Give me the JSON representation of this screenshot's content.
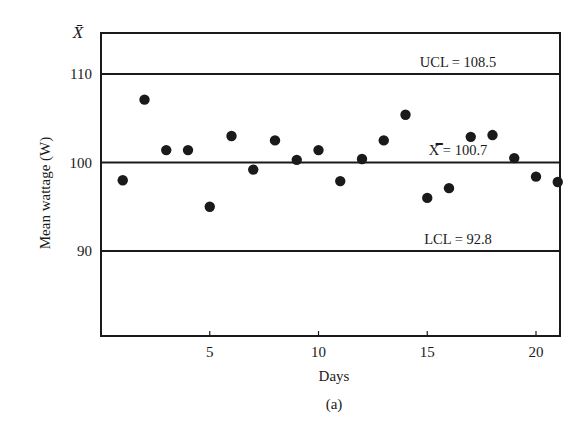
{
  "chart_data": {
    "type": "scatter",
    "title": "",
    "subtitle": "",
    "caption": "(a)",
    "xlabel": "Days",
    "ylabel": "Mean wattage (W)",
    "y_axis_symbol": "X̄",
    "xlim": [
      0,
      21
    ],
    "ylim": [
      80,
      113.5
    ],
    "x_ticks": [
      5,
      10,
      15,
      20
    ],
    "y_ticks": [
      90,
      100,
      110
    ],
    "grid": false,
    "legend": null,
    "x": [
      1,
      2,
      3,
      4,
      5,
      6,
      7,
      8,
      9,
      10,
      11,
      12,
      13,
      14,
      15,
      16,
      17,
      18,
      19,
      20,
      21
    ],
    "series": [
      {
        "name": "Daily mean wattage",
        "marker": "filled-circle",
        "values": [
          98.0,
          107.1,
          101.4,
          101.4,
          95.0,
          103.0,
          99.2,
          102.5,
          100.3,
          101.4,
          97.9,
          100.4,
          102.5,
          105.4,
          96.0,
          97.1,
          102.9,
          103.1,
          100.5,
          98.4,
          97.8
        ]
      }
    ],
    "control_lines": [
      {
        "name": "UCL",
        "label": "UCL = 108.5",
        "value": 108.5,
        "draw_at": 110
      },
      {
        "name": "center",
        "label": "X̿ = 100.7",
        "value": 100.7,
        "draw_at": 100
      },
      {
        "name": "LCL",
        "label": "LCL = 92.8",
        "value": 92.8,
        "draw_at": 90
      }
    ]
  },
  "colors": {
    "ink": "#1a1a1a",
    "background": "#ffffff"
  }
}
